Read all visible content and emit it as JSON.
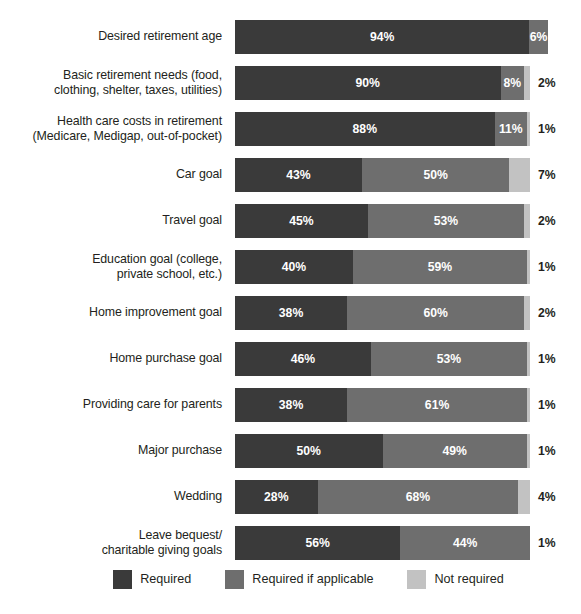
{
  "title_remnant": "",
  "colors": {
    "required": "#3a3a3a",
    "required_if_applicable": "#6e6e6e",
    "not_required": "#c2c2c2",
    "background": "#ffffff",
    "text": "#231f20"
  },
  "legend": {
    "position": "bottom-center",
    "items": [
      {
        "label": "Required",
        "color": "#3a3a3a",
        "swatch": "required"
      },
      {
        "label": "Required if applicable",
        "color": "#6e6e6e",
        "swatch": "required-if"
      },
      {
        "label": "Not required",
        "color": "#c2c2c2",
        "swatch": "not-required"
      }
    ]
  },
  "chart_data": {
    "type": "bar",
    "subtype": "stacked-horizontal-100pct",
    "title": "",
    "xlabel": "",
    "ylabel": "",
    "xlim": [
      0,
      100
    ],
    "grid": false,
    "legend_position": "bottom",
    "categories": [
      "Desired retirement age",
      "Basic retirement needs (food, clothing, shelter, taxes, utilities)",
      "Health care costs in retirement (Medicare, Medigap, out-of-pocket)",
      "Car goal",
      "Travel goal",
      "Education goal (college, private school, etc.)",
      "Home improvement goal",
      "Home purchase goal",
      "Providing care for parents",
      "Major purchase",
      "Wedding",
      "Leave bequest/ charitable giving goals"
    ],
    "series": [
      {
        "name": "Required",
        "color": "#3a3a3a",
        "values": [
          94,
          90,
          88,
          43,
          45,
          40,
          38,
          46,
          38,
          50,
          28,
          56
        ]
      },
      {
        "name": "Required if applicable",
        "color": "#6e6e6e",
        "values": [
          6,
          8,
          11,
          50,
          53,
          59,
          60,
          53,
          61,
          49,
          68,
          44
        ]
      },
      {
        "name": "Not required",
        "color": "#c2c2c2",
        "values": [
          0,
          2,
          1,
          7,
          2,
          1,
          2,
          1,
          1,
          1,
          4,
          1
        ]
      }
    ]
  },
  "rows": [
    {
      "label_lines": [
        "Desired retirement age"
      ],
      "required": {
        "value": 94,
        "label": "94%"
      },
      "required_if": {
        "value": 6,
        "label": "6%"
      },
      "not_required": {
        "value": 0,
        "label": ""
      },
      "outside_label": ""
    },
    {
      "label_lines": [
        "Basic retirement needs (food,",
        "clothing, shelter, taxes, utilities)"
      ],
      "required": {
        "value": 90,
        "label": "90%"
      },
      "required_if": {
        "value": 8,
        "label": "8%"
      },
      "not_required": {
        "value": 2,
        "label": ""
      },
      "outside_label": "2%"
    },
    {
      "label_lines": [
        "Health care costs in retirement",
        "(Medicare, Medigap, out-of-pocket)"
      ],
      "required": {
        "value": 88,
        "label": "88%"
      },
      "required_if": {
        "value": 11,
        "label": "11%"
      },
      "not_required": {
        "value": 1,
        "label": ""
      },
      "outside_label": "1%"
    },
    {
      "label_lines": [
        "Car goal"
      ],
      "required": {
        "value": 43,
        "label": "43%"
      },
      "required_if": {
        "value": 50,
        "label": "50%"
      },
      "not_required": {
        "value": 7,
        "label": ""
      },
      "outside_label": "7%"
    },
    {
      "label_lines": [
        "Travel goal"
      ],
      "required": {
        "value": 45,
        "label": "45%"
      },
      "required_if": {
        "value": 53,
        "label": "53%"
      },
      "not_required": {
        "value": 2,
        "label": ""
      },
      "outside_label": "2%"
    },
    {
      "label_lines": [
        "Education goal (college,",
        "private school, etc.)"
      ],
      "required": {
        "value": 40,
        "label": "40%"
      },
      "required_if": {
        "value": 59,
        "label": "59%"
      },
      "not_required": {
        "value": 1,
        "label": ""
      },
      "outside_label": "1%"
    },
    {
      "label_lines": [
        "Home improvement goal"
      ],
      "required": {
        "value": 38,
        "label": "38%"
      },
      "required_if": {
        "value": 60,
        "label": "60%"
      },
      "not_required": {
        "value": 2,
        "label": ""
      },
      "outside_label": "2%"
    },
    {
      "label_lines": [
        "Home purchase goal"
      ],
      "required": {
        "value": 46,
        "label": "46%"
      },
      "required_if": {
        "value": 53,
        "label": "53%"
      },
      "not_required": {
        "value": 1,
        "label": ""
      },
      "outside_label": "1%"
    },
    {
      "label_lines": [
        "Providing care for parents"
      ],
      "required": {
        "value": 38,
        "label": "38%"
      },
      "required_if": {
        "value": 61,
        "label": "61%"
      },
      "not_required": {
        "value": 1,
        "label": ""
      },
      "outside_label": "1%"
    },
    {
      "label_lines": [
        "Major purchase"
      ],
      "required": {
        "value": 50,
        "label": "50%"
      },
      "required_if": {
        "value": 49,
        "label": "49%"
      },
      "not_required": {
        "value": 1,
        "label": ""
      },
      "outside_label": "1%"
    },
    {
      "label_lines": [
        "Wedding"
      ],
      "required": {
        "value": 28,
        "label": "28%"
      },
      "required_if": {
        "value": 68,
        "label": "68%"
      },
      "not_required": {
        "value": 4,
        "label": ""
      },
      "outside_label": "4%"
    },
    {
      "label_lines": [
        "Leave bequest/",
        "charitable giving goals"
      ],
      "required": {
        "value": 56,
        "label": "56%"
      },
      "required_if": {
        "value": 44,
        "label": "44%"
      },
      "not_required": {
        "value": 0,
        "label": ""
      },
      "outside_label": "1%"
    }
  ]
}
